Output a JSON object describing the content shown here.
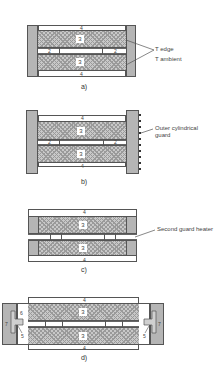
{
  "figure": {
    "panels": [
      {
        "id": "a",
        "caption": "a)",
        "labels": [
          "T edge",
          "T ambient"
        ],
        "region_numbers": {
          "top": "4",
          "upper": "3",
          "gap_left": "2",
          "gap_center": "1",
          "gap_right": "2",
          "lower": "3",
          "bottom": "4"
        }
      },
      {
        "id": "b",
        "caption": "b)",
        "labels": [
          "Outer cylindrical",
          "guard"
        ],
        "region_numbers": {
          "top": "4",
          "upper": "3",
          "gap_left": "2",
          "gap_center": "1",
          "gap_right": "2",
          "lower": "3",
          "bottom": "4"
        }
      },
      {
        "id": "c",
        "caption": "c)",
        "labels": [
          "Second guard heater"
        ],
        "region_numbers": {
          "top": "4",
          "upper": "3",
          "gap_left": "2",
          "gap_center": "1",
          "gap_right": "2",
          "lower": "3",
          "bottom": "4"
        }
      },
      {
        "id": "d",
        "caption": "d)",
        "labels": [],
        "region_numbers": {
          "top": "4",
          "upper": "3",
          "gap_left": "2",
          "gap_center": "1",
          "gap_right": "2",
          "lower": "3",
          "bottom": "4",
          "left_6": "6",
          "left_7": "7",
          "left_5": "5",
          "right_7": "7",
          "right_5": "5"
        }
      }
    ]
  }
}
